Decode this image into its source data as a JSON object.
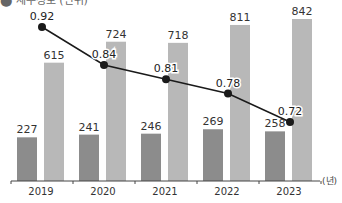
{
  "header": {
    "clipped_title": "⬤ 세부정보 (단위)"
  },
  "chart_data": {
    "type": "bar+line",
    "title": "",
    "categories": [
      "2019",
      "2020",
      "2021",
      "2022",
      "2023"
    ],
    "x_unit_label": "(년)",
    "series": [
      {
        "name": "series_dark",
        "kind": "bar",
        "color": "#8c8c8c",
        "values": [
          227,
          241,
          246,
          269,
          258
        ],
        "labels": [
          "227",
          "241",
          "246",
          "269",
          "258"
        ]
      },
      {
        "name": "series_light",
        "kind": "bar",
        "color": "#b8b8b8",
        "values": [
          615,
          724,
          718,
          811,
          842
        ],
        "labels": [
          "615",
          "724",
          "718",
          "811",
          "842"
        ]
      },
      {
        "name": "ratio",
        "kind": "line",
        "color": "#1a1a1a",
        "values": [
          0.92,
          0.84,
          0.81,
          0.78,
          0.72
        ],
        "labels": [
          "0.92",
          "0.84",
          "0.81",
          "0.78",
          "0.72"
        ]
      }
    ],
    "bar_ylim": [
      0,
      842
    ],
    "grid": false,
    "legend": "none"
  }
}
